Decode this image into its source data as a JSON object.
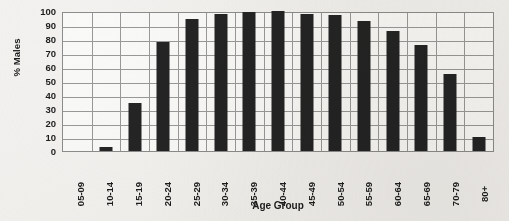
{
  "chart_data": {
    "type": "bar",
    "title": "",
    "xlabel": "Age Group",
    "ylabel": "% Males",
    "ylim": [
      0,
      100
    ],
    "ytick_step": 10,
    "grid": true,
    "legend": "none",
    "bar_color": "#242424",
    "plot_background": "#fbfbfa",
    "grid_color": "#9a9a9a",
    "axis_color": "#8d8d8d",
    "categories": [
      "05-09",
      "10-14",
      "15-19",
      "20-24",
      "25-29",
      "30-34",
      "35-39",
      "40-44",
      "45-49",
      "50-54",
      "55-59",
      "60-64",
      "65-69",
      "70-79",
      "80+"
    ],
    "values": [
      0,
      3,
      34,
      78,
      94,
      98,
      99,
      100,
      98,
      97,
      93,
      86,
      76,
      55,
      10
    ],
    "yticks": [
      0,
      10,
      20,
      30,
      40,
      50,
      60,
      70,
      80,
      90,
      100
    ],
    "ytick_labels": [
      "0",
      "10",
      "20",
      "30",
      "40",
      "50",
      "60",
      "70",
      "80",
      "90",
      "100"
    ]
  }
}
